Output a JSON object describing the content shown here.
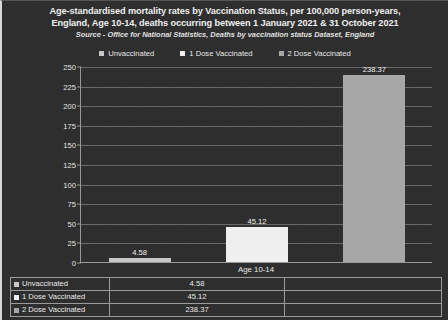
{
  "title": {
    "line1": "Age-standardised mortality rates by Vaccination Status, per 100,000 person-years,",
    "line2": "England, Age 10-14, deaths occurring between 1 January 2021 & 31 October 2021",
    "source": "Source - Office for National Statistics, Deaths by vaccination status Dataset, England"
  },
  "legend": [
    {
      "label": "Unvaccinated",
      "color": "#c9c9c9"
    },
    {
      "label": "1 Dose Vaccinated",
      "color": "#f2f2f2"
    },
    {
      "label": "2 Dose Vaccinated",
      "color": "#a8a8a8"
    }
  ],
  "table": {
    "rows": [
      {
        "name": "Unvaccinated",
        "value": "4.58",
        "color": "#c9c9c9"
      },
      {
        "name": "1 Dose Vaccinated",
        "value": "45.12",
        "color": "#f2f2f2"
      },
      {
        "name": "2 Dose Vaccinated",
        "value": "238.37",
        "color": "#a8a8a8"
      }
    ]
  },
  "chart_data": {
    "type": "bar",
    "title": "Age-standardised mortality rates by Vaccination Status, per 100,000 person-years, England, Age 10-14, deaths occurring between 1 January 2021 & 31 October 2021",
    "subtitle": "Source - Office for National Statistics, Deaths by vaccination status Dataset, England",
    "categories": [
      "Age 10-14"
    ],
    "series": [
      {
        "name": "Unvaccinated",
        "values": [
          4.58
        ],
        "color": "#c9c9c9"
      },
      {
        "name": "1 Dose Vaccinated",
        "values": [
          45.12
        ],
        "color": "#f2f2f2"
      },
      {
        "name": "2 Dose Vaccinated",
        "values": [
          238.37
        ],
        "color": "#a8a8a8"
      }
    ],
    "xlabel": "",
    "ylabel": "",
    "ylim": [
      0,
      250
    ],
    "yticks": [
      0,
      25,
      50,
      75,
      100,
      125,
      150,
      175,
      200,
      225,
      250
    ],
    "ytick_labels": [
      "0",
      "25",
      "50",
      "75",
      "100",
      "125",
      "150",
      "175",
      "200",
      "225",
      "250"
    ],
    "data_labels": [
      "4.58",
      "45.12",
      "238.37"
    ],
    "grid": true,
    "legend_position": "top",
    "background": "#2e2e2e",
    "text_color": "#eaeaea"
  }
}
